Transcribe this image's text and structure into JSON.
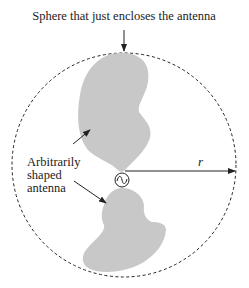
{
  "diagram": {
    "title_label": "Sphere that just encloses the antenna",
    "antenna_label": [
      "Arbitrarily",
      "shaped",
      "antenna"
    ],
    "radius_label": "r",
    "source_symbol": "~",
    "colors": {
      "antenna_fill": "#c8c8c8",
      "stroke": "#222222",
      "background": "#ffffff"
    }
  }
}
